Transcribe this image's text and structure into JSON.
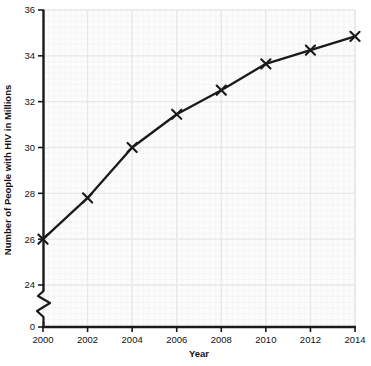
{
  "chart_data": {
    "type": "line",
    "title": "",
    "xlabel": "Year",
    "ylabel": "Number of People with HIV in Millions",
    "x": [
      2000,
      2002,
      2004,
      2006,
      2008,
      2010,
      2012,
      2014
    ],
    "values": [
      26.0,
      27.8,
      30.0,
      31.45,
      32.5,
      33.65,
      34.25,
      34.85
    ],
    "series": [
      {
        "name": "Number of People with HIV in Millions",
        "values": [
          26.0,
          27.8,
          30.0,
          31.45,
          32.5,
          33.65,
          34.25,
          34.85
        ]
      }
    ],
    "xlim": [
      2000,
      2014
    ],
    "ylim": [
      24,
      36
    ],
    "y_axis_break": true,
    "y_break_from": 0,
    "y_break_to": 24,
    "xticks": [
      2000,
      2002,
      2004,
      2006,
      2008,
      2010,
      2012,
      2014
    ],
    "xtick_labels": [
      "2000",
      "2002",
      "2004",
      "2006",
      "2008",
      "2010",
      "2012",
      "2014"
    ],
    "yticks": [
      0,
      24,
      26,
      28,
      30,
      32,
      34,
      36
    ],
    "ytick_labels": [
      "0",
      "24",
      "26",
      "28",
      "30",
      "32",
      "34",
      "36"
    ],
    "grid": true,
    "minor_grid": true,
    "legend": "none",
    "marker": "x",
    "line_color": "#1a1a1a",
    "marker_color": "#1a1a1a",
    "grid_color": "#e8e8e8",
    "minor_grid_color": "#f2f2f2",
    "axis_color": "#1a1a1a",
    "background": "#ffffff",
    "plot_background": "#fbfbfb"
  },
  "geometry": {
    "plot_left": 43,
    "plot_right": 355,
    "plot_top": 10,
    "plot_bottom": 285,
    "axis_baseline_y": 327,
    "break_top_y": 291,
    "break_bottom_y": 322
  }
}
